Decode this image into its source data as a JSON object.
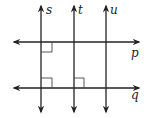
{
  "diagram": {
    "type": "geometry-lines",
    "vertical_lines": [
      {
        "name": "s",
        "x": 41
      },
      {
        "name": "t",
        "x": 74
      },
      {
        "name": "u",
        "x": 106
      }
    ],
    "horizontal_lines": [
      {
        "name": "p",
        "y": 42
      },
      {
        "name": "q",
        "y": 88
      }
    ],
    "right_angle_marks": [
      {
        "at": "s-p",
        "quadrant": "below-right"
      },
      {
        "at": "s-q",
        "quadrant": "above-right"
      },
      {
        "at": "t-q",
        "quadrant": "above-right"
      }
    ],
    "labels": {
      "s": "s",
      "t": "t",
      "u": "u",
      "p": "p",
      "q": "q"
    },
    "colors": {
      "line": "#222222",
      "background": "#ffffff"
    }
  }
}
